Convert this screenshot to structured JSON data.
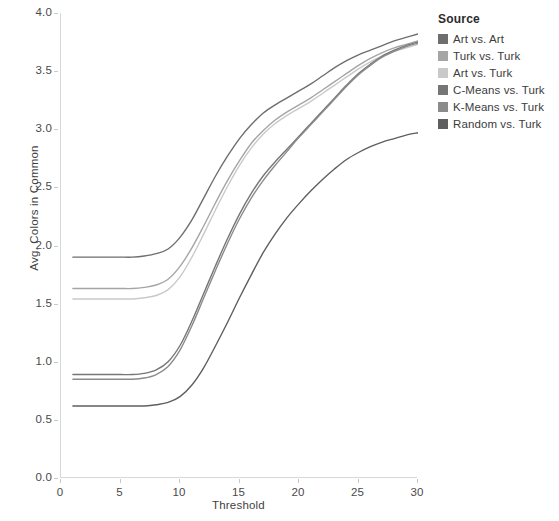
{
  "chart_data": {
    "type": "line",
    "title": "",
    "xlabel": "Threshold",
    "ylabel": "Avg. Colors in Common",
    "xlim": [
      0,
      30
    ],
    "ylim": [
      0.0,
      4.0
    ],
    "xticks": [
      0,
      5,
      10,
      15,
      20,
      25,
      30
    ],
    "xtick_labels": [
      "0",
      "5",
      "10",
      "15",
      "20",
      "25",
      "30"
    ],
    "yticks": [
      0.0,
      0.5,
      1.0,
      1.5,
      2.0,
      2.5,
      3.0,
      3.5,
      4.0
    ],
    "ytick_labels": [
      "0.0",
      "0.5",
      "1.0",
      "1.5",
      "2.0",
      "2.5",
      "3.0",
      "3.5",
      "4.0"
    ],
    "grid": false,
    "legend_position": "right",
    "legend_title": "Source",
    "x": [
      1,
      2,
      3,
      4,
      5,
      6,
      7,
      8,
      9,
      10,
      11,
      12,
      13,
      14,
      15,
      16,
      17,
      18,
      19,
      20,
      21,
      22,
      23,
      24,
      25,
      26,
      27,
      28,
      29,
      30
    ],
    "series": [
      {
        "name": "Art vs. Art",
        "color": "#6e6e6e",
        "values": [
          1.9,
          1.9,
          1.9,
          1.9,
          1.9,
          1.9,
          1.91,
          1.93,
          1.97,
          2.07,
          2.22,
          2.41,
          2.6,
          2.77,
          2.92,
          3.04,
          3.14,
          3.21,
          3.27,
          3.33,
          3.39,
          3.46,
          3.53,
          3.59,
          3.64,
          3.68,
          3.72,
          3.76,
          3.79,
          3.82
        ]
      },
      {
        "name": "Turk vs. Turk",
        "color": "#a5a5a5",
        "values": [
          1.63,
          1.63,
          1.63,
          1.63,
          1.63,
          1.63,
          1.64,
          1.66,
          1.71,
          1.82,
          1.98,
          2.17,
          2.37,
          2.56,
          2.73,
          2.88,
          2.99,
          3.08,
          3.15,
          3.21,
          3.27,
          3.34,
          3.41,
          3.48,
          3.55,
          3.61,
          3.66,
          3.7,
          3.73,
          3.76
        ]
      },
      {
        "name": "Art vs. Turk",
        "color": "#c9c9c9",
        "values": [
          1.54,
          1.54,
          1.54,
          1.54,
          1.54,
          1.54,
          1.55,
          1.57,
          1.62,
          1.73,
          1.9,
          2.1,
          2.31,
          2.51,
          2.69,
          2.84,
          2.96,
          3.05,
          3.12,
          3.18,
          3.24,
          3.31,
          3.38,
          3.45,
          3.52,
          3.58,
          3.63,
          3.67,
          3.7,
          3.73
        ]
      },
      {
        "name": "C-Means vs. Turk",
        "color": "#767676",
        "values": [
          0.89,
          0.89,
          0.89,
          0.89,
          0.89,
          0.89,
          0.9,
          0.93,
          1.0,
          1.14,
          1.35,
          1.59,
          1.83,
          2.06,
          2.27,
          2.45,
          2.6,
          2.72,
          2.83,
          2.94,
          3.05,
          3.16,
          3.27,
          3.38,
          3.48,
          3.56,
          3.63,
          3.68,
          3.72,
          3.75
        ]
      },
      {
        "name": "K-Means vs. Turk",
        "color": "#8b8b8b",
        "values": [
          0.85,
          0.85,
          0.85,
          0.85,
          0.85,
          0.85,
          0.86,
          0.89,
          0.96,
          1.1,
          1.31,
          1.55,
          1.79,
          2.02,
          2.23,
          2.41,
          2.56,
          2.69,
          2.81,
          2.93,
          3.04,
          3.15,
          3.26,
          3.37,
          3.47,
          3.55,
          3.62,
          3.67,
          3.71,
          3.74
        ]
      },
      {
        "name": "Random vs. Turk",
        "color": "#5f5f5f",
        "values": [
          0.62,
          0.62,
          0.62,
          0.62,
          0.62,
          0.62,
          0.62,
          0.63,
          0.65,
          0.7,
          0.8,
          0.95,
          1.14,
          1.34,
          1.55,
          1.75,
          1.94,
          2.1,
          2.24,
          2.36,
          2.47,
          2.57,
          2.66,
          2.74,
          2.8,
          2.85,
          2.89,
          2.92,
          2.95,
          2.97
        ]
      }
    ]
  }
}
